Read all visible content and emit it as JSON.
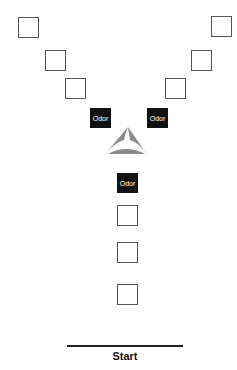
{
  "diagram": {
    "type": "y-maze-odor-layout",
    "colors": {
      "box_border": "#555555",
      "odor_fill": "#111111",
      "odor_text": "#ffffff",
      "maze_fill": "#8a8a8a",
      "start_line": "#222222"
    },
    "left_arm_boxes": [
      {
        "x": 18,
        "y": 17
      },
      {
        "x": 45,
        "y": 50
      },
      {
        "x": 65,
        "y": 78
      }
    ],
    "right_arm_boxes": [
      {
        "x": 211,
        "y": 16
      },
      {
        "x": 191,
        "y": 50
      },
      {
        "x": 165,
        "y": 78
      }
    ],
    "stem_boxes": [
      {
        "x": 117,
        "y": 205
      },
      {
        "x": 117,
        "y": 242
      },
      {
        "x": 117,
        "y": 284
      }
    ],
    "odor_markers": [
      {
        "label": "Odor",
        "x": 90,
        "y": 108
      },
      {
        "label": "Odor",
        "x": 147,
        "y": 108
      },
      {
        "label": "Odor",
        "x": 117,
        "y": 173
      }
    ],
    "center_icon": "y-maze-triangle-icon",
    "start": {
      "label": "Start"
    }
  }
}
